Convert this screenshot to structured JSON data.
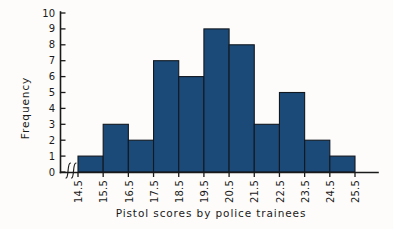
{
  "chart_data": {
    "type": "bar",
    "title": "",
    "xlabel": "Pistol scores by police trainees",
    "ylabel": "Frequency",
    "categories": [
      "14.5-15.5",
      "15.5-16.5",
      "16.5-17.5",
      "17.5-18.5",
      "18.5-19.5",
      "19.5-20.5",
      "20.5-21.5",
      "21.5-22.5",
      "22.5-23.5",
      "23.5-24.5",
      "24.5-25.5"
    ],
    "values": [
      1,
      3,
      2,
      7,
      6,
      9,
      8,
      3,
      5,
      2,
      1
    ],
    "bin_edges": [
      14.5,
      15.5,
      16.5,
      17.5,
      18.5,
      19.5,
      20.5,
      21.5,
      22.5,
      23.5,
      24.5,
      25.5
    ],
    "x_tick_labels": [
      "14.5",
      "15.5",
      "16.5",
      "17.5",
      "18.5",
      "19.5",
      "20.5",
      "21.5",
      "22.5",
      "23.5",
      "24.5",
      "25.5"
    ],
    "y_tick_labels": [
      "0",
      "1",
      "2",
      "3",
      "4",
      "5",
      "6",
      "7",
      "8",
      "9",
      "10"
    ],
    "y_values": [
      0,
      1,
      2,
      3,
      4,
      5,
      6,
      7,
      8,
      9,
      10
    ],
    "ylim": [
      0,
      10
    ],
    "xlim": [
      14.5,
      25.5
    ],
    "grid": false,
    "legend": false,
    "axis_break": true,
    "axis_break_symbol": "//",
    "total_count": 47,
    "bar_color": "#1b4a78",
    "bar_edge_color": "#111820",
    "axis_color": "#1a1a1a",
    "background_color": "#fdfcfa"
  }
}
